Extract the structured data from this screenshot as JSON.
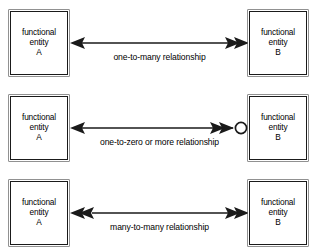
{
  "diagram": {
    "colors": {
      "background": "#ffffff",
      "stroke": "#1a1a1a",
      "box_outer": "#4a4a4a",
      "text": "#000000"
    },
    "entity_labels": {
      "line1": "functional",
      "line2": "entity",
      "suffix_a": "A",
      "suffix_b": "B"
    },
    "rows": [
      {
        "id": "one-to-many",
        "caption": "one-to-many relationship",
        "left_entity": {
          "line1": "functional",
          "line2": "entity",
          "line3": "A"
        },
        "right_entity": {
          "line1": "functional",
          "line2": "entity",
          "line3": "B"
        },
        "left_terminator": "single-arrowhead",
        "right_terminator": "double-chevron",
        "left_cardinality": "one",
        "right_cardinality": "many"
      },
      {
        "id": "one-to-zero-or-more",
        "caption": "one-to-zero or more relationship",
        "left_entity": {
          "line1": "functional",
          "line2": "entity",
          "line3": "A"
        },
        "right_entity": {
          "line1": "functional",
          "line2": "entity",
          "line3": "B"
        },
        "left_terminator": "single-arrowhead",
        "right_terminator": "double-chevron-with-circle",
        "left_cardinality": "one",
        "right_cardinality": "zero or more"
      },
      {
        "id": "many-to-many",
        "caption": "many-to-many relationship",
        "left_entity": {
          "line1": "functional",
          "line2": "entity",
          "line3": "A"
        },
        "right_entity": {
          "line1": "functional",
          "line2": "entity",
          "line3": "B"
        },
        "left_terminator": "double-chevron",
        "right_terminator": "double-chevron",
        "left_cardinality": "many",
        "right_cardinality": "many"
      }
    ]
  }
}
